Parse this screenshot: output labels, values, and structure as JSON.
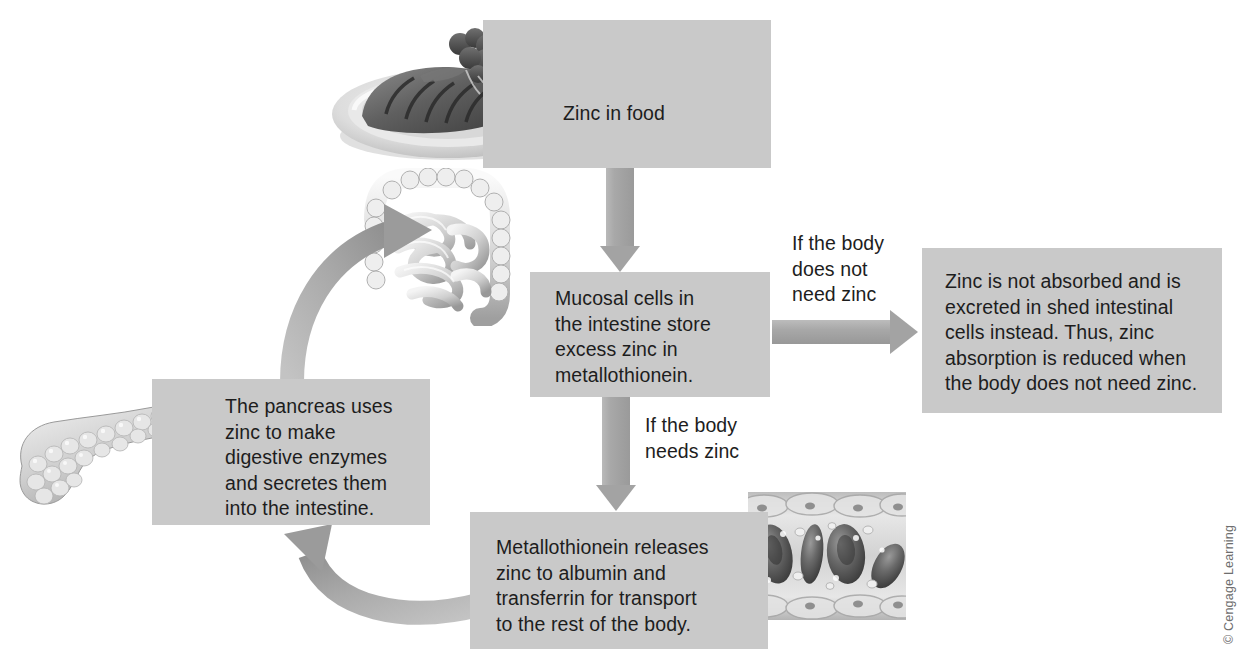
{
  "figure": {
    "credit": "© Cengage Learning",
    "box_fill": "#c9c9c9",
    "arrow_fill": "#a3a3a3",
    "text_color": "#1d1d1d",
    "background": "#ffffff"
  },
  "boxes": {
    "food": {
      "text": "Zinc in food",
      "illustration": "plate-of-steak-illustration"
    },
    "mucosal": {
      "text": "Mucosal cells in\nthe intestine store\nexcess zinc in\nmetallothionein.",
      "illustration": "intestine-illustration"
    },
    "not_absorbed": {
      "text": "Zinc is not absorbed and is\nexcreted in shed intestinal\ncells instead. Thus, zinc\nabsorption is reduced when\nthe body does not need zinc."
    },
    "release": {
      "text": "Metallothionein releases\nzinc to albumin and\ntransferrin for transport\nto the rest of the body.",
      "illustration": "blood-vessel-red-blood-cells-illustration"
    },
    "pancreas": {
      "text": "The pancreas uses\nzinc to make\ndigestive enzymes\nand secretes them\ninto the intestine.",
      "illustration": "pancreas-illustration"
    }
  },
  "labels": {
    "no_need": "If the body\ndoes not\nneed zinc",
    "need": "If the body\nneeds zinc"
  },
  "arrows": {
    "food_to_mucosal": "zinc in food enters mucosal cells",
    "mucosal_to_not_absorbed": "if the body does not need zinc",
    "mucosal_to_release": "if the body needs zinc",
    "release_to_pancreas": "zinc returns to the pancreas",
    "pancreas_to_intestine": "pancreas secretes zinc into the intestine"
  }
}
